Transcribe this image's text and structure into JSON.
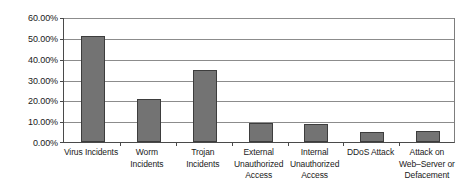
{
  "chart_data": {
    "type": "bar",
    "title": "",
    "xlabel": "",
    "ylabel": "",
    "ylim": [
      0,
      60
    ],
    "grid": true,
    "legend": false,
    "y_tick_labels": [
      "60.00%",
      "50.00%",
      "40.00%",
      "30.00%",
      "20.00%",
      "10.00%",
      "0.00%"
    ],
    "y_tick_values": [
      60,
      50,
      40,
      30,
      20,
      10,
      0
    ],
    "categories": [
      "Virus Incidents",
      "Worm Incidents",
      "Trojan Incidents",
      "External Unauthorized Access",
      "Internal Unauthorized Access",
      "DDoS Attack",
      "Attack on Web–Server or Defacement"
    ],
    "category_lines": [
      [
        "Virus Incidents"
      ],
      [
        "Worm",
        "Incidents"
      ],
      [
        "Trojan",
        "Incidents"
      ],
      [
        "External",
        "Unauthorized",
        "Access"
      ],
      [
        "Internal",
        "Unauthorized",
        "Access"
      ],
      [
        "DDoS Attack"
      ],
      [
        "Attack on",
        "Web–Server or",
        "Defacement"
      ]
    ],
    "values": [
      51.5,
      21.0,
      35.0,
      9.0,
      8.5,
      5.0,
      5.5
    ],
    "series": [
      {
        "name": "Incidents",
        "values": [
          51.5,
          21.0,
          35.0,
          9.0,
          8.5,
          5.0,
          5.5
        ]
      }
    ],
    "colors": {
      "bar_fill": "#737373",
      "bar_stroke": "#3d3d3d",
      "gridline": "#8c8c8c",
      "axis": "#4a4a4a",
      "text": "#1a1a1a",
      "background": "#ffffff"
    }
  }
}
